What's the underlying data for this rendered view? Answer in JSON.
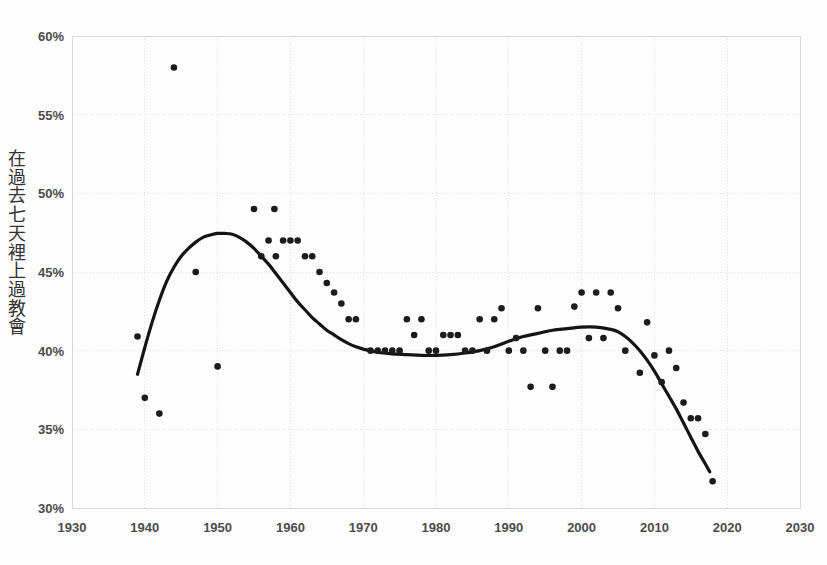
{
  "chart_data": {
    "type": "scatter",
    "title": "",
    "subtitle": "",
    "xlabel": "",
    "ylabel": "在過去七天裡上過教會",
    "ylabel_chars": [
      "在",
      "過",
      "去",
      "七",
      "天",
      "裡",
      "上",
      "過",
      "教",
      "會"
    ],
    "xlim": [
      1930,
      2030
    ],
    "ylim": [
      30,
      60
    ],
    "xticks": [
      1930,
      1940,
      1950,
      1960,
      1970,
      1980,
      1990,
      2000,
      2010,
      2020,
      2030
    ],
    "xtick_labels": [
      "1930",
      "1940",
      "1950",
      "1960",
      "1970",
      "1980",
      "1990",
      "2000",
      "2010",
      "2020",
      "2030"
    ],
    "yticks": [
      30,
      35,
      40,
      45,
      50,
      55,
      60
    ],
    "ytick_labels": [
      "30%",
      "35%",
      "40%",
      "45%",
      "50%",
      "55%",
      "60%"
    ],
    "grid": true,
    "legend": "none",
    "point_color": "#1c1c1c",
    "line_color": "#141414",
    "grid_color": "#dedede",
    "series": [
      {
        "name": "在過去七天裡上過教會",
        "marker": "circle",
        "points": [
          {
            "x": 1939,
            "y": 40.9
          },
          {
            "x": 1940,
            "y": 37.0
          },
          {
            "x": 1942,
            "y": 36.0
          },
          {
            "x": 1944,
            "y": 58.0
          },
          {
            "x": 1947,
            "y": 45.0
          },
          {
            "x": 1950,
            "y": 39.0
          },
          {
            "x": 1955,
            "y": 49.0
          },
          {
            "x": 1956,
            "y": 46.0
          },
          {
            "x": 1957,
            "y": 47.0
          },
          {
            "x": 1957.8,
            "y": 49.0
          },
          {
            "x": 1958,
            "y": 46.0
          },
          {
            "x": 1959,
            "y": 47.0
          },
          {
            "x": 1960,
            "y": 47.0
          },
          {
            "x": 1961,
            "y": 47.0
          },
          {
            "x": 1962,
            "y": 46.0
          },
          {
            "x": 1963,
            "y": 46.0
          },
          {
            "x": 1964,
            "y": 45.0
          },
          {
            "x": 1965,
            "y": 44.3
          },
          {
            "x": 1966,
            "y": 43.7
          },
          {
            "x": 1967,
            "y": 43.0
          },
          {
            "x": 1968,
            "y": 42.0
          },
          {
            "x": 1969,
            "y": 42.0
          },
          {
            "x": 1971,
            "y": 40.0
          },
          {
            "x": 1972,
            "y": 40.0
          },
          {
            "x": 1973,
            "y": 40.0
          },
          {
            "x": 1974,
            "y": 40.0
          },
          {
            "x": 1975,
            "y": 40.0
          },
          {
            "x": 1976,
            "y": 42.0
          },
          {
            "x": 1977,
            "y": 41.0
          },
          {
            "x": 1978,
            "y": 42.0
          },
          {
            "x": 1979,
            "y": 40.0
          },
          {
            "x": 1980,
            "y": 40.0
          },
          {
            "x": 1981,
            "y": 41.0
          },
          {
            "x": 1982,
            "y": 41.0
          },
          {
            "x": 1983,
            "y": 41.0
          },
          {
            "x": 1984,
            "y": 40.0
          },
          {
            "x": 1985,
            "y": 40.0
          },
          {
            "x": 1986,
            "y": 42.0
          },
          {
            "x": 1987,
            "y": 40.0
          },
          {
            "x": 1988,
            "y": 42.0
          },
          {
            "x": 1989,
            "y": 42.7
          },
          {
            "x": 1990,
            "y": 40.0
          },
          {
            "x": 1991,
            "y": 40.8
          },
          {
            "x": 1992,
            "y": 40.0
          },
          {
            "x": 1993,
            "y": 37.7
          },
          {
            "x": 1994,
            "y": 42.7
          },
          {
            "x": 1995,
            "y": 40.0
          },
          {
            "x": 1996,
            "y": 37.7
          },
          {
            "x": 1997,
            "y": 40.0
          },
          {
            "x": 1998,
            "y": 40.0
          },
          {
            "x": 1999,
            "y": 42.8
          },
          {
            "x": 2000,
            "y": 43.7
          },
          {
            "x": 2001,
            "y": 40.8
          },
          {
            "x": 2002,
            "y": 43.7
          },
          {
            "x": 2003,
            "y": 40.8
          },
          {
            "x": 2004,
            "y": 43.7
          },
          {
            "x": 2005,
            "y": 42.7
          },
          {
            "x": 2006,
            "y": 40.0
          },
          {
            "x": 2008,
            "y": 38.6
          },
          {
            "x": 2009,
            "y": 41.8
          },
          {
            "x": 2010,
            "y": 39.7
          },
          {
            "x": 2011,
            "y": 38.0
          },
          {
            "x": 2012,
            "y": 40.0
          },
          {
            "x": 2013,
            "y": 38.9
          },
          {
            "x": 2014,
            "y": 36.7
          },
          {
            "x": 2015,
            "y": 35.7
          },
          {
            "x": 2016,
            "y": 35.7
          },
          {
            "x": 2017,
            "y": 34.7
          },
          {
            "x": 2018,
            "y": 31.7
          }
        ]
      }
    ],
    "trend": {
      "name": "smoothed-trend",
      "points": [
        {
          "x": 1939.0,
          "y": 38.5
        },
        {
          "x": 1940.0,
          "y": 40.2
        },
        {
          "x": 1941.0,
          "y": 41.8
        },
        {
          "x": 1942.0,
          "y": 43.2
        },
        {
          "x": 1943.0,
          "y": 44.4
        },
        {
          "x": 1944.0,
          "y": 45.3
        },
        {
          "x": 1945.0,
          "y": 46.0
        },
        {
          "x": 1946.0,
          "y": 46.5
        },
        {
          "x": 1947.0,
          "y": 46.9
        },
        {
          "x": 1948.0,
          "y": 47.2
        },
        {
          "x": 1949.0,
          "y": 47.35
        },
        {
          "x": 1950.0,
          "y": 47.45
        },
        {
          "x": 1951.0,
          "y": 47.45
        },
        {
          "x": 1952.0,
          "y": 47.4
        },
        {
          "x": 1953.0,
          "y": 47.2
        },
        {
          "x": 1954.0,
          "y": 46.9
        },
        {
          "x": 1955.0,
          "y": 46.5
        },
        {
          "x": 1956.0,
          "y": 46.0
        },
        {
          "x": 1957.0,
          "y": 45.5
        },
        {
          "x": 1958.0,
          "y": 44.9
        },
        {
          "x": 1959.0,
          "y": 44.3
        },
        {
          "x": 1960.0,
          "y": 43.7
        },
        {
          "x": 1961.0,
          "y": 43.1
        },
        {
          "x": 1962.0,
          "y": 42.6
        },
        {
          "x": 1963.0,
          "y": 42.1
        },
        {
          "x": 1964.0,
          "y": 41.7
        },
        {
          "x": 1965.0,
          "y": 41.3
        },
        {
          "x": 1966.0,
          "y": 41.0
        },
        {
          "x": 1967.0,
          "y": 40.7
        },
        {
          "x": 1968.0,
          "y": 40.45
        },
        {
          "x": 1969.0,
          "y": 40.25
        },
        {
          "x": 1970.0,
          "y": 40.1
        },
        {
          "x": 1972.0,
          "y": 39.9
        },
        {
          "x": 1974.0,
          "y": 39.8
        },
        {
          "x": 1976.0,
          "y": 39.75
        },
        {
          "x": 1978.0,
          "y": 39.7
        },
        {
          "x": 1980.0,
          "y": 39.7
        },
        {
          "x": 1982.0,
          "y": 39.75
        },
        {
          "x": 1984.0,
          "y": 39.85
        },
        {
          "x": 1986.0,
          "y": 40.0
        },
        {
          "x": 1988.0,
          "y": 40.25
        },
        {
          "x": 1990.0,
          "y": 40.6
        },
        {
          "x": 1992.0,
          "y": 40.9
        },
        {
          "x": 1994.0,
          "y": 41.1
        },
        {
          "x": 1996.0,
          "y": 41.3
        },
        {
          "x": 1998.0,
          "y": 41.4
        },
        {
          "x": 2000.0,
          "y": 41.5
        },
        {
          "x": 2002.0,
          "y": 41.5
        },
        {
          "x": 2004.0,
          "y": 41.35
        },
        {
          "x": 2005.0,
          "y": 41.2
        },
        {
          "x": 2006.0,
          "y": 40.9
        },
        {
          "x": 2007.0,
          "y": 40.5
        },
        {
          "x": 2008.0,
          "y": 40.0
        },
        {
          "x": 2009.0,
          "y": 39.4
        },
        {
          "x": 2010.0,
          "y": 38.7
        },
        {
          "x": 2011.0,
          "y": 37.9
        },
        {
          "x": 2012.0,
          "y": 37.1
        },
        {
          "x": 2013.0,
          "y": 36.3
        },
        {
          "x": 2014.0,
          "y": 35.4
        },
        {
          "x": 2015.0,
          "y": 34.5
        },
        {
          "x": 2016.0,
          "y": 33.6
        },
        {
          "x": 2017.0,
          "y": 32.8
        },
        {
          "x": 2017.6,
          "y": 32.3
        }
      ]
    }
  }
}
